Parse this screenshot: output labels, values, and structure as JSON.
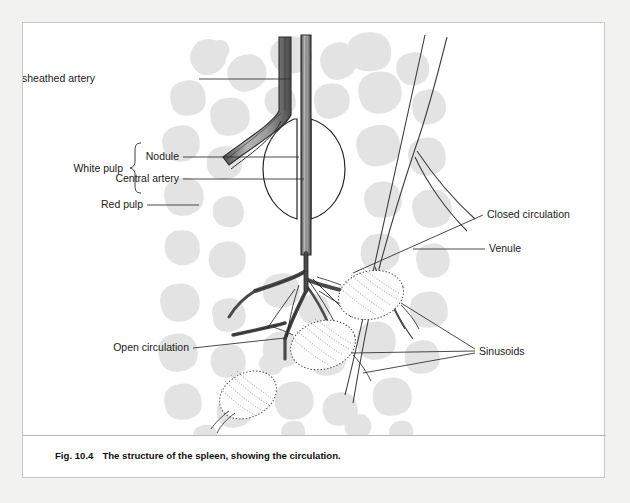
{
  "figure": {
    "caption_number": "Fig. 10.4",
    "caption_title": "The structure of the spleen, showing the circulation.",
    "border_color": "#c9c9c7",
    "background": "#ffffff",
    "page_background": "#f2f2f0"
  },
  "labels": {
    "ensheathed_artery": "Ensheathed artery",
    "white_pulp": "White pulp",
    "nodule": "Nodule",
    "central_artery": "Central artery",
    "red_pulp": "Red pulp",
    "open_circulation": "Open circulation",
    "closed_circulation": "Closed circulation",
    "venule": "Venule",
    "sinusoids": "Sinusoids"
  },
  "colors": {
    "red_pulp_blob": "#e2e2e2",
    "artery_stroke": "#2b2b2b",
    "artery_fill": "#8c8c8c",
    "vessel_outline": "#3a3a3a",
    "leader_line": "#2b2b2b",
    "sinusoid_stipple": "#4a4a4a",
    "text": "#1a1a1a"
  },
  "structures": {
    "nodule_shape": "circle",
    "sinusoid_count": 3,
    "sinusoid_shape": "stippled-oval",
    "venule_shape": "outlined-vessel-pair",
    "artery_shape": "filled-branching-tree"
  }
}
